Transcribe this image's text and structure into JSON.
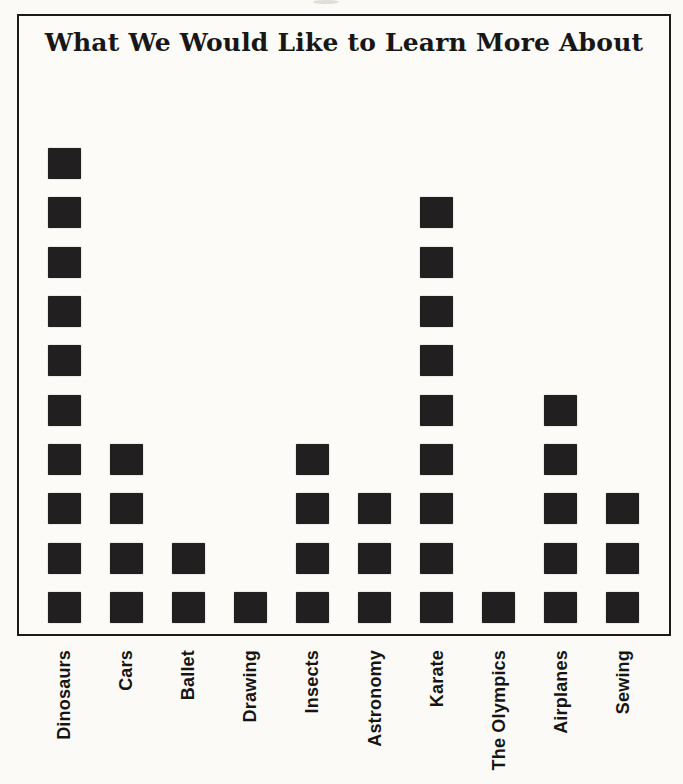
{
  "title": "What We Would Like to Learn More About",
  "colors": {
    "square": "#221f20",
    "frame_border": "#1b1b1b",
    "paper_background": "#fbfaf6",
    "text": "#181716"
  },
  "chart_data": {
    "type": "bar",
    "subtype": "pictograph",
    "symbol": "filled-square",
    "unit_per_symbol": 1,
    "title": "What We Would Like to Learn More About",
    "xlabel": "",
    "ylabel": "",
    "categories": [
      "Dinosaurs",
      "Cars",
      "Ballet",
      "Drawing",
      "Insects",
      "Astronomy",
      "Karate",
      "The Olympics",
      "Airplanes",
      "Sewing"
    ],
    "values": [
      10,
      4,
      2,
      1,
      4,
      3,
      9,
      1,
      5,
      3
    ],
    "ylim": [
      0,
      10
    ],
    "grid": false,
    "legend": "none",
    "category_label_rotation_deg": -90
  }
}
